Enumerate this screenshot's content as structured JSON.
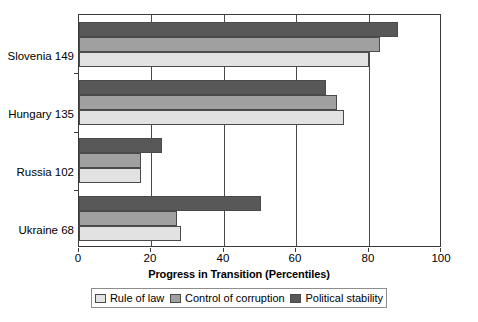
{
  "chart_data": {
    "type": "bar",
    "orientation": "horizontal",
    "title": "",
    "xlabel": "Progress in Transition (Percentiles)",
    "ylabel": "",
    "xlim": [
      0,
      100
    ],
    "xticks": [
      0,
      20,
      40,
      60,
      80,
      100
    ],
    "grid": true,
    "legend_position": "bottom",
    "categories": [
      "Slovenia 149",
      "Hungary 135",
      "Russia 102",
      "Ukraine 68"
    ],
    "series": [
      {
        "name": "Rule of law",
        "color": "#e2e2e2",
        "values": [
          80,
          73,
          17,
          28
        ]
      },
      {
        "name": "Control of corruption",
        "color": "#a0a0a0",
        "values": [
          83,
          71,
          17,
          27
        ]
      },
      {
        "name": "Political stability",
        "color": "#585858",
        "values": [
          88,
          68,
          23,
          50
        ]
      }
    ]
  },
  "axis": {
    "x_tick_labels": [
      "0",
      "20",
      "40",
      "60",
      "80",
      "100"
    ],
    "x_title": "Progress in Transition (Percentiles)"
  },
  "legend": {
    "items": [
      {
        "label": "Rule of law"
      },
      {
        "label": "Control of corruption"
      },
      {
        "label": "Political stability"
      }
    ]
  }
}
